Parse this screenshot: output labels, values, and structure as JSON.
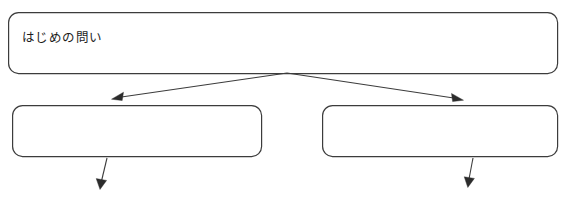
{
  "canvas": {
    "width": 568,
    "height": 200,
    "background_color": "#ffffff",
    "line_color": "#3c3c3c",
    "arrow_color": "#2c2c2c",
    "text_color": "#1d1d1d"
  },
  "diagram": {
    "type": "branching-flow-chart",
    "nodes": [
      {
        "id": "root-question",
        "name": "root-question-box",
        "label": "はじめの問い",
        "x": 8,
        "y": 12,
        "width": 550,
        "height": 62,
        "corner_radius": 10,
        "empty": false
      },
      {
        "id": "branch-left",
        "name": "branch-left-box",
        "label": "",
        "x": 12,
        "y": 105,
        "width": 250,
        "height": 52,
        "corner_radius": 10,
        "empty": true
      },
      {
        "id": "branch-right",
        "name": "branch-right-box",
        "label": "",
        "x": 322,
        "y": 105,
        "width": 236,
        "height": 52,
        "corner_radius": 10,
        "empty": true
      }
    ],
    "connectors": [
      {
        "id": "root-to-left",
        "name": "arrow-root-to-branch-left",
        "from": "root-question",
        "to": "branch-left",
        "start": [
          287,
          73
        ],
        "end": [
          112,
          99
        ],
        "direction": "down-left"
      },
      {
        "id": "root-to-right",
        "name": "arrow-root-to-branch-right",
        "from": "root-question",
        "to": "branch-right",
        "start": [
          287,
          73
        ],
        "end": [
          463,
          100
        ],
        "direction": "down-right"
      },
      {
        "id": "left-downward",
        "name": "arrow-branch-left-downward",
        "from": "branch-left",
        "to": "",
        "start": [
          107,
          158
        ],
        "end": [
          100,
          189
        ],
        "direction": "down"
      },
      {
        "id": "right-downward",
        "name": "arrow-branch-right-downward",
        "from": "branch-right",
        "to": "",
        "start": [
          473,
          158
        ],
        "end": [
          468,
          187
        ],
        "direction": "down"
      }
    ]
  }
}
